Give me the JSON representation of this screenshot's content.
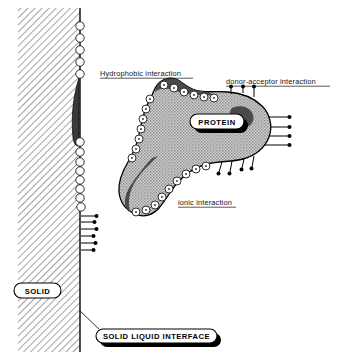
{
  "figure": {
    "width": 338,
    "height": 360,
    "background_color": "#ffffff"
  },
  "labels": {
    "hydrophobic": {
      "text": "Hydrophobic interaction",
      "underlined": true,
      "x": 100,
      "y": 76
    },
    "donor_acceptor": {
      "text": "donor-acceptor interaction",
      "underlined": true,
      "x": 226,
      "y": 84
    },
    "ionic": {
      "text": "ionic interaction",
      "underlined": true,
      "x": 178,
      "y": 205
    }
  },
  "pills": {
    "protein": {
      "text": "PROTEIN",
      "x": 190,
      "y": 115,
      "width": 54,
      "height": 15,
      "shadow": true,
      "shadow_color": "#000000",
      "fill": "#ffffff"
    },
    "solid": {
      "text": "SOLID",
      "x": 14,
      "y": 283,
      "width": 47,
      "height": 15,
      "shadow": false,
      "fill": "#ffffff"
    },
    "solid_liquid_interface": {
      "text": "SOLID LIQUID INTERFACE",
      "x": 96,
      "y": 329,
      "width": 121,
      "height": 14,
      "shadow": true,
      "shadow_color": "#000000",
      "fill": "#ffffff"
    }
  },
  "solid_phase": {
    "name": "solid substrate",
    "hatch_angle_degrees": 45,
    "hatch_color": "#8a8a8a",
    "left": 18,
    "right": 80,
    "top": 8,
    "bottom": 352
  },
  "interface": {
    "name": "solid liquid interface line",
    "x": 80,
    "y_top": 8,
    "y_bottom": 352,
    "color": "#000000"
  },
  "wall_features": {
    "upper_circle_count": 5,
    "lower_circle_count": 8,
    "wall_pin_count": 6,
    "dark_lens_label": "hydrophobic domain on surface",
    "dark_lens_color": "#3a3a3a"
  },
  "protein": {
    "name": "adsorbed protein molecule",
    "fill_pattern": "stipple",
    "fill_color": "#b4b4b4",
    "outline_color": "#000000",
    "hydrophobic_patch_color": "#4a4a4a",
    "perimeter_site_count": 28,
    "donor_acceptor_pins": {
      "top_count": 3,
      "right_count": 4,
      "bottom_count": 4
    }
  },
  "legend_notes": {
    "circle_symbol_meaning": "ionic / charged site",
    "pin_symbol_meaning": "donor-acceptor group",
    "dark_patch_meaning": "hydrophobic region"
  }
}
